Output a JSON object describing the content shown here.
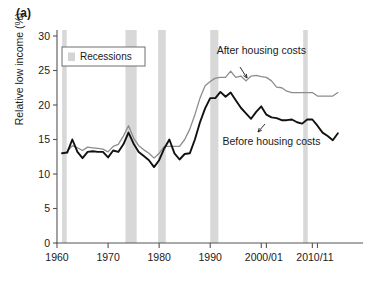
{
  "figure": {
    "panel_label": "(a)",
    "ylabel": "Relative low income (%)"
  },
  "legend": {
    "position": "top-left-inside",
    "entries": [
      {
        "label": "Recessions",
        "swatch_color": "#d4d4d4"
      }
    ]
  },
  "annotations": [
    {
      "name": "after-housing-costs",
      "text": "After housing costs",
      "x": 2000,
      "y": 27.4
    },
    {
      "name": "before-housing-costs",
      "text": "Before housing costs",
      "x": 2002,
      "y": 14.2
    }
  ],
  "colors": {
    "before_housing_costs": "#111111",
    "after_housing_costs": "#8c8c8c",
    "recession_band": "#d8d8d8",
    "axis": "#555555",
    "background": "#ffffff"
  },
  "chart_data": {
    "type": "line",
    "title": "",
    "subtitle": "",
    "xlabel": "",
    "ylabel": "Relative low income (%)",
    "xlim": [
      1960,
      2016
    ],
    "ylim": [
      0,
      30
    ],
    "yticks": [
      0,
      5,
      10,
      15,
      20,
      25,
      30
    ],
    "ytick_labels": [
      "0",
      "5",
      "10",
      "15",
      "20",
      "25",
      "30"
    ],
    "xticks": [
      1960,
      1970,
      1980,
      1990,
      2000,
      2001,
      2010,
      2011
    ],
    "xtick_labels": [
      {
        "value": 1960,
        "label": "1960"
      },
      {
        "value": 1970,
        "label": "1970"
      },
      {
        "value": 1980,
        "label": "1980"
      },
      {
        "value": 1990,
        "label": "1990"
      },
      {
        "value": 2000.5,
        "label": "2000/01"
      },
      {
        "value": 2010.5,
        "label": "2010/11"
      }
    ],
    "grid": false,
    "legend_position": "upper left",
    "x": [
      1961,
      1962,
      1963,
      1964,
      1965,
      1966,
      1967,
      1968,
      1969,
      1970,
      1971,
      1972,
      1973,
      1974,
      1975,
      1976,
      1977,
      1978,
      1979,
      1980,
      1981,
      1982,
      1983,
      1984,
      1985,
      1986,
      1987,
      1988,
      1989,
      1990,
      1991,
      1992,
      1993,
      1994,
      1995,
      1996,
      1997,
      1998,
      1999,
      2000,
      2001,
      2002,
      2003,
      2004,
      2005,
      2006,
      2007,
      2008,
      2009,
      2010,
      2011,
      2012,
      2013,
      2014,
      2015
    ],
    "series": [
      {
        "name": "Before housing costs",
        "color": "#111111",
        "values": [
          13.0,
          13.1,
          15.0,
          13.2,
          12.3,
          13.2,
          13.3,
          13.2,
          13.2,
          12.4,
          13.4,
          13.2,
          14.3,
          16.0,
          14.4,
          13.2,
          12.6,
          12.0,
          11.0,
          12.0,
          13.7,
          15.0,
          13.0,
          12.1,
          12.9,
          13.0,
          15.0,
          17.5,
          19.5,
          21.0,
          21.0,
          21.9,
          21.2,
          21.8,
          20.7,
          19.6,
          18.8,
          18.0,
          19.0,
          19.8,
          18.6,
          18.2,
          18.1,
          17.8,
          17.8,
          17.9,
          17.5,
          17.3,
          17.9,
          17.9,
          17.0,
          16.0,
          15.5,
          14.9,
          15.9
        ]
      },
      {
        "name": "After housing costs",
        "color": "#8c8c8c",
        "values": [
          13.0,
          13.3,
          14.1,
          13.8,
          13.4,
          13.9,
          13.8,
          13.7,
          13.6,
          13.2,
          14.0,
          14.3,
          15.5,
          17.0,
          15.2,
          14.1,
          13.5,
          13.0,
          12.3,
          13.0,
          14.0,
          14.0,
          14.0,
          14.0,
          15.0,
          16.5,
          18.6,
          21.0,
          22.8,
          23.4,
          23.9,
          24.0,
          24.0,
          24.9,
          24.0,
          24.2,
          23.5,
          24.2,
          24.3,
          24.1,
          24.0,
          23.5,
          22.6,
          22.5,
          22.0,
          21.8,
          21.8,
          21.8,
          21.8,
          21.8,
          21.3,
          21.3,
          21.3,
          21.3,
          21.8
        ]
      }
    ],
    "recessions": [
      {
        "start": 1961.0,
        "end": 1961.9
      },
      {
        "start": 1973.4,
        "end": 1975.6
      },
      {
        "start": 1979.8,
        "end": 1981.3
      },
      {
        "start": 1990.0,
        "end": 1991.6
      },
      {
        "start": 2008.2,
        "end": 2009.1
      }
    ]
  }
}
